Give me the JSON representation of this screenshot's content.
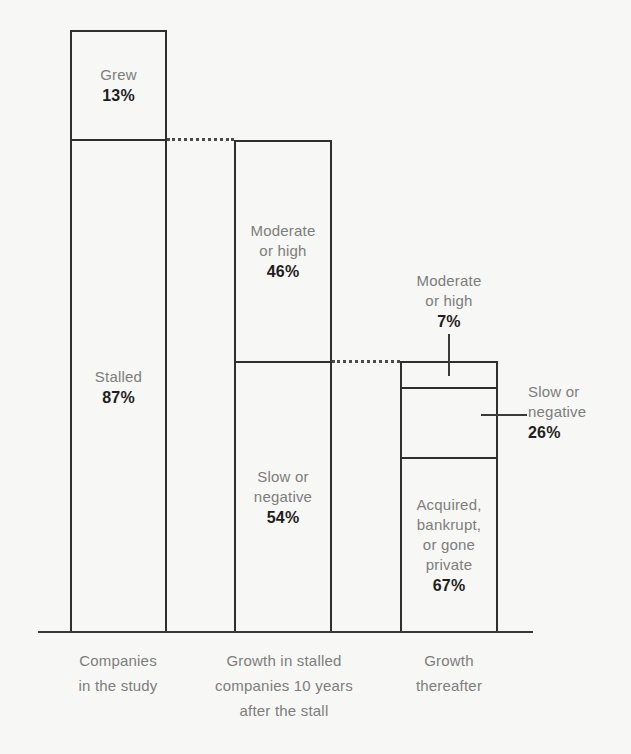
{
  "chart_data": {
    "type": "bar",
    "title": "",
    "subtitle": "",
    "xlabel": "",
    "ylabel": "",
    "grid": false,
    "legend": "none",
    "orientation": "vertical",
    "stacked": true,
    "ylim": [
      0,
      100
    ],
    "units": "percent",
    "categories": [
      "Companies\nin the study",
      "Growth in stalled\ncompanies 10 years\nafter the stall",
      "Growth\nthereafter"
    ],
    "bars": [
      {
        "category": "Companies in the study",
        "total_height_pct": 100,
        "segments": [
          {
            "label": "Grew",
            "value": 13,
            "value_text": "13%",
            "label_position": "inside"
          },
          {
            "label": "Stalled",
            "value": 87,
            "value_text": "87%",
            "label_position": "inside"
          }
        ]
      },
      {
        "category": "Growth in stalled companies 10 years after the stall",
        "total_height_pct": 87,
        "segments": [
          {
            "label": "Moderate\nor high",
            "value": 46,
            "value_text": "46%",
            "label_position": "inside"
          },
          {
            "label": "Slow or\nnegative",
            "value": 54,
            "value_text": "54%",
            "label_position": "inside"
          }
        ]
      },
      {
        "category": "Growth thereafter",
        "total_height_pct": 54,
        "segments": [
          {
            "label": "Moderate\nor high",
            "value": 7,
            "value_text": "7%",
            "label_position": "callout-above"
          },
          {
            "label": "Slow or\nnegative",
            "value": 26,
            "value_text": "26%",
            "label_position": "callout-right"
          },
          {
            "label": "Acquired,\nbankrupt,\nor gone\nprivate",
            "value": 67,
            "value_text": "67%",
            "label_position": "inside"
          }
        ]
      }
    ],
    "connectors": [
      {
        "from_bar": 1,
        "from_boundary": "Grew/Stalled",
        "to_bar": 2,
        "to_boundary": "top",
        "style": "dotted"
      },
      {
        "from_bar": 2,
        "from_boundary": "Moderate or high/Slow or negative",
        "to_bar": 3,
        "to_boundary": "top",
        "style": "dotted"
      }
    ],
    "colors": {
      "background": "#f7f7f5",
      "bar_outline": "#2f2f2f",
      "axis": "#3a3a3a",
      "label_text": "#7d7d7d",
      "value_text": "#1e1e1e",
      "connector": "#4a4a4a"
    }
  },
  "bar1": {
    "grew": {
      "label": "Grew",
      "value": "13%"
    },
    "stalled": {
      "label": "Stalled",
      "value": "87%"
    }
  },
  "bar2": {
    "moderate_high": {
      "label": "Moderate\nor high",
      "value": "46%"
    },
    "slow_negative": {
      "label": "Slow or\nnegative",
      "value": "54%"
    }
  },
  "bar3": {
    "moderate_high": {
      "label": "Moderate\nor high",
      "value": "7%"
    },
    "slow_negative": {
      "label": "Slow or\nnegative",
      "value": "26%"
    },
    "acquired": {
      "label": "Acquired,\nbankrupt,\nor gone\nprivate",
      "value": "67%"
    }
  },
  "categories": {
    "c0": "Companies\nin the study",
    "c1": "Growth in stalled\ncompanies 10 years\nafter the stall",
    "c2": "Growth\nthereafter"
  }
}
